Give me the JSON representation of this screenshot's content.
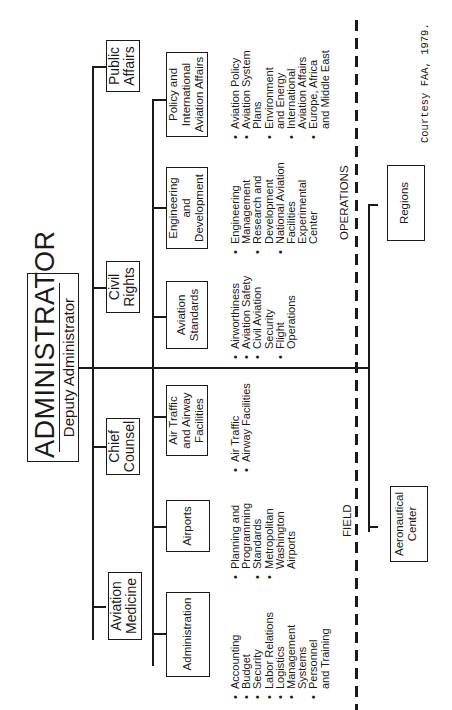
{
  "chart": {
    "title": "ADMINISTRATOR",
    "subtitle": "Deputy Administrator",
    "orientation": "rotated 90° counter-clockwise",
    "staff_offices": [
      {
        "label": "Public Affairs"
      },
      {
        "label": "Civil Rights"
      },
      {
        "label": "Chief Counsel"
      },
      {
        "label": "Aviation Medicine"
      }
    ],
    "line_offices": [
      {
        "label": "Policy and International Aviation Affairs",
        "items": [
          "Aviation Policy",
          "Aviation System Plans",
          "Environment and Energy",
          "International Aviation Affairs",
          "Europe, Africa and Middle East"
        ]
      },
      {
        "label": "Engineering and Development",
        "items": [
          "Engineering Management",
          "Research and Development",
          "National Aviation Facilities Experimental Center"
        ]
      },
      {
        "label": "Aviation Standards",
        "items": [
          "Airworthiness",
          "Aviation Safety",
          "Civil Aviation Security",
          "Flight Operations"
        ]
      },
      {
        "label": "Air Traffic and Airway Facilities",
        "items": [
          "Air Traffic",
          "Airway Facilities"
        ]
      },
      {
        "label": "Airports",
        "items": [
          "Planning and Programming",
          "Standards",
          "Metropolitan Washington Airports"
        ]
      },
      {
        "label": "Administration",
        "items": [
          "Accounting",
          "Budget",
          "Security",
          "Labor Relations",
          "Logistics",
          "Management Systems",
          "Personnel and Training"
        ]
      }
    ],
    "divider_labels": {
      "operations": "OPERATIONS",
      "field": "FIELD"
    },
    "field_offices": [
      {
        "label": "Regions"
      },
      {
        "label": "Aeronautical Center"
      }
    ],
    "credit": "Courtesy FAA, 1979."
  },
  "text": {
    "pa1": "Public",
    "pa2": "Affairs",
    "cr1": "Civil",
    "cr2": "Rights",
    "cc1": "Chief",
    "cc2": "Counsel",
    "am1": "Aviation",
    "am2": "Medicine",
    "pol1": "Policy and",
    "pol2": "International",
    "pol3": "Aviation Affairs",
    "eng1": "Engineering",
    "eng2": "and",
    "eng3": "Development",
    "std1": "Aviation",
    "std2": "Standards",
    "atf1": "Air Traffic",
    "atf2": "and Airway",
    "atf3": "Facilities",
    "air1": "Airports",
    "adm1": "Administration",
    "reg1": "Regions",
    "aer1": "Aeronautical",
    "aer2": "Center",
    "pol_l": [
      "Aviation Policy",
      "Aviation System",
      "Plans",
      "Environment",
      "and Energy",
      "International",
      "Aviation Affairs",
      "Europe, Africa",
      "and Middle East"
    ],
    "eng_l": [
      "Engineering",
      "Management",
      "Research and",
      "Development",
      "National Aviation",
      "Facilities",
      "Experimental",
      "Center"
    ],
    "std_l": [
      "Airworthiness",
      "Aviation Safety",
      "Civil Aviation",
      "Security",
      "Flight",
      "Operations"
    ],
    "atf_l": [
      "Air Traffic",
      "Airway Facilities"
    ],
    "air_l": [
      "Planning and",
      "Programming",
      "Standards",
      "Metropolitan",
      "Washington",
      "Airports"
    ],
    "adm_l": [
      "Accounting",
      "Budget",
      "Security",
      "Labor Relations",
      "Logistics",
      "Management",
      "Systems",
      "Personnel",
      "and Training"
    ]
  }
}
